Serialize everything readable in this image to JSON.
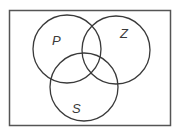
{
  "diagram": {
    "type": "venn",
    "universe": {
      "x": 9,
      "y": 10,
      "width": 162,
      "height": 116,
      "stroke": "#555555"
    },
    "sets": [
      {
        "label": "P",
        "cx": 67,
        "cy": 49,
        "r": 34,
        "label_x": 52,
        "label_y": 45
      },
      {
        "label": "Z",
        "cx": 116,
        "cy": 50,
        "r": 34,
        "label_x": 120,
        "label_y": 38
      },
      {
        "label": "S",
        "cx": 84,
        "cy": 87,
        "r": 34,
        "label_x": 72,
        "label_y": 113
      }
    ],
    "stroke_color": "#3a3a3a"
  }
}
